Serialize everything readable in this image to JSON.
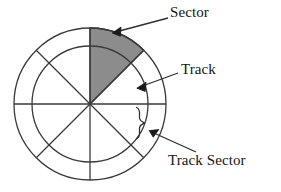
{
  "diagram": {
    "background_color": "#ffffff",
    "line_color": "#3a3a3a",
    "text_color": "#151515",
    "shaded_sector_fill": "#8c8c8c",
    "geometry": {
      "center_x": 90,
      "center_y": 104,
      "outer_radius": 76,
      "inner_radius": 58,
      "spoke_count": 8,
      "spoke_angle_step_degrees": 45
    },
    "labels": [
      {
        "id": "sector",
        "text": "Sector",
        "arrow_from_x": 168,
        "arrow_from_y": 18,
        "arrow_to_x": 113,
        "arrow_to_y": 33
      },
      {
        "id": "track",
        "text": "Track",
        "arrow_from_x": 178,
        "arrow_from_y": 73,
        "arrow_to_x": 138,
        "arrow_to_y": 88
      },
      {
        "id": "track-sector",
        "text": "Track Sector",
        "arrow_from_x": 196,
        "arrow_from_y": 152,
        "arrow_to_x": 150,
        "arrow_to_y": 130
      }
    ],
    "brace": {
      "id": "track-sector-brace",
      "orientation": "opens-left",
      "top_y": 107,
      "bottom_y": 139,
      "x": 140
    }
  }
}
